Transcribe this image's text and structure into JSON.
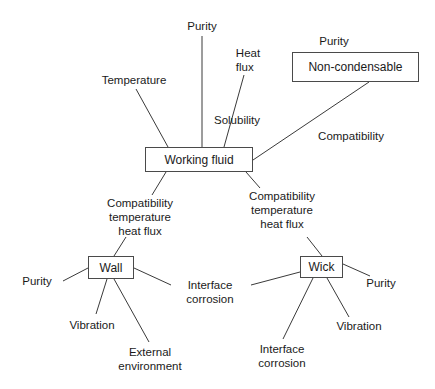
{
  "diagram": {
    "type": "concept-map",
    "colors": {
      "line": "#3a3a3a",
      "box_border": "#4a4a4a",
      "text": "#1a1a1a",
      "background": "#ffffff"
    },
    "nodes": {
      "working_fluid": {
        "label": "Working fluid",
        "x": 145,
        "y": 147,
        "w": 108,
        "h": 25
      },
      "non_condensable": {
        "label": "Non-condensable",
        "x": 292,
        "y": 52,
        "w": 127,
        "h": 30
      },
      "wall": {
        "label": "Wall",
        "x": 88,
        "y": 256,
        "w": 46,
        "h": 23
      },
      "wick": {
        "label": "Wick",
        "x": 300,
        "y": 256,
        "w": 43,
        "h": 22
      }
    },
    "labels": {
      "temperature": {
        "lines": [
          "Temperature"
        ],
        "x": 134,
        "y": 73
      },
      "purity_top": {
        "lines": [
          "Purity"
        ],
        "x": 202,
        "y": 19
      },
      "heat_flux": {
        "lines": [
          "Heat",
          "flux"
        ],
        "x": 248,
        "y": 46
      },
      "solubility": {
        "lines": [
          "Solubility"
        ],
        "x": 237,
        "y": 113
      },
      "purity_noncond": {
        "lines": [
          "Purity"
        ],
        "x": 334,
        "y": 34
      },
      "compatibility_noncond": {
        "lines": [
          "Compatibility"
        ],
        "x": 351,
        "y": 129
      },
      "compat_left": {
        "lines": [
          "Compatibility",
          "temperature",
          "heat flux"
        ],
        "x": 140,
        "y": 196
      },
      "compat_right": {
        "lines": [
          "Compatibility",
          "temperature",
          "heat flux"
        ],
        "x": 282,
        "y": 189
      },
      "wall_purity": {
        "lines": [
          "Purity"
        ],
        "x": 37,
        "y": 274
      },
      "wall_vibration": {
        "lines": [
          "Vibration"
        ],
        "x": 92,
        "y": 318
      },
      "wall_external": {
        "lines": [
          "External",
          "environment"
        ],
        "x": 150,
        "y": 345
      },
      "interface_corrosion_mid": {
        "lines": [
          "Interface",
          "corrosion"
        ],
        "x": 210,
        "y": 278
      },
      "wick_interface_corrosion": {
        "lines": [
          "Interface",
          "corrosion"
        ],
        "x": 282,
        "y": 342
      },
      "wick_vibration": {
        "lines": [
          "Vibration"
        ],
        "x": 359,
        "y": 319
      },
      "wick_purity": {
        "lines": [
          "Purity"
        ],
        "x": 381,
        "y": 276
      }
    },
    "edges": [
      {
        "from": "temperature",
        "to": "working_fluid",
        "x1": 136,
        "y1": 89,
        "x2": 168,
        "y2": 147
      },
      {
        "from": "purity_top",
        "to": "working_fluid",
        "x1": 202,
        "y1": 36,
        "x2": 202,
        "y2": 147
      },
      {
        "from": "heat_flux",
        "to": "working_fluid",
        "x1": 244,
        "y1": 75,
        "x2": 224,
        "y2": 147
      },
      {
        "from": "non_condensable",
        "to": "working_fluid",
        "x1": 369,
        "y1": 82,
        "x2": 253,
        "y2": 160
      },
      {
        "from": "working_fluid",
        "to": "compat_left",
        "x1": 166,
        "y1": 172,
        "x2": 152,
        "y2": 195
      },
      {
        "from": "working_fluid",
        "to": "compat_right",
        "x1": 246,
        "y1": 172,
        "x2": 260,
        "y2": 188
      },
      {
        "from": "compat_left",
        "to": "wall",
        "x1": 126,
        "y1": 237,
        "x2": 114,
        "y2": 256
      },
      {
        "from": "compat_right",
        "to": "wick",
        "x1": 307,
        "y1": 237,
        "x2": 322,
        "y2": 256
      },
      {
        "from": "wall",
        "to": "wall_purity",
        "x1": 88,
        "y1": 268,
        "x2": 63,
        "y2": 281
      },
      {
        "from": "wall",
        "to": "wall_vibration",
        "x1": 107,
        "y1": 279,
        "x2": 96,
        "y2": 314
      },
      {
        "from": "wall",
        "to": "wall_external",
        "x1": 114,
        "y1": 279,
        "x2": 149,
        "y2": 342
      },
      {
        "from": "wall",
        "to": "interface_corrosion_mid",
        "x1": 134,
        "y1": 268,
        "x2": 171,
        "y2": 285
      },
      {
        "from": "wick",
        "to": "interface_corrosion_mid",
        "x1": 300,
        "y1": 272,
        "x2": 251,
        "y2": 285
      },
      {
        "from": "wick",
        "to": "wick_interface_corrosion",
        "x1": 313,
        "y1": 278,
        "x2": 283,
        "y2": 339
      },
      {
        "from": "wick",
        "to": "wick_vibration",
        "x1": 327,
        "y1": 278,
        "x2": 349,
        "y2": 317
      },
      {
        "from": "wick",
        "to": "wick_purity",
        "x1": 343,
        "y1": 264,
        "x2": 370,
        "y2": 276
      }
    ]
  }
}
